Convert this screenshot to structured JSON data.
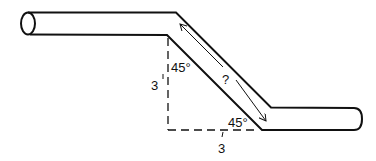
{
  "diagram": {
    "colors": {
      "stroke": "#111111",
      "background": "#ffffff"
    },
    "labels": {
      "upper_angle": "45°",
      "lower_angle": "45°",
      "vertical_offset": "3",
      "vertical_offset_mark": "'",
      "horizontal_run": "3",
      "horizontal_run_mark": "'",
      "diagonal_length": "?"
    }
  }
}
